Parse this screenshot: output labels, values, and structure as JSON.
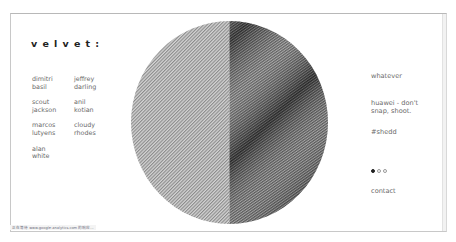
{
  "brand": {
    "logo": "velvet:"
  },
  "left_nav": {
    "names": [
      "dimitri\nbasil",
      "jeffrey\ndarling",
      "scout\njackson",
      "anil\nkotian",
      "marcos\nlutyens",
      "cloudy\nrhodes",
      "alan\nwhite"
    ]
  },
  "right_nav": {
    "items": [
      "whatever",
      "huawei - don't\nsnap, shoot.",
      "#shedd"
    ],
    "carousel": {
      "total": 3,
      "active_index": 0
    },
    "contact": "contact"
  },
  "hero": {
    "graphic": "halftone-circle",
    "colors": {
      "light": "#b8b8b8",
      "dark": "#3a3a3a",
      "bg": "#ffffff"
    }
  },
  "status_bar": {
    "text": "正在等待 www.google-analytics.com 的响应..."
  }
}
